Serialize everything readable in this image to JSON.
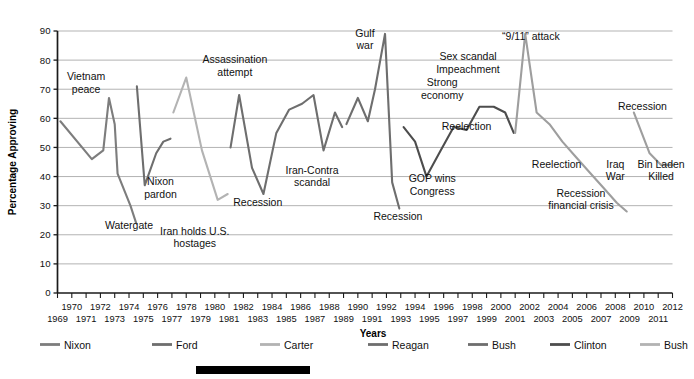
{
  "chart_data": {
    "type": "line",
    "title": "",
    "xlabel": "Years",
    "ylabel": "Percentage Approving",
    "ylim": [
      0,
      90
    ],
    "ytick_step": 10,
    "yticks": [
      "0",
      "10",
      "20",
      "30",
      "40",
      "50",
      "60",
      "70",
      "80",
      "90"
    ],
    "xlim": [
      1969,
      2012
    ],
    "grid": "horizontal",
    "legend_position": "bottom",
    "xticks_top_row": [
      "1970",
      "1972",
      "1974",
      "1976",
      "1978",
      "1980",
      "1982",
      "1984",
      "1986",
      "1988",
      "1990",
      "1992",
      "1994",
      "1996",
      "1998",
      "2000",
      "2002",
      "2004",
      "2006",
      "2008",
      "2010",
      "2012"
    ],
    "xticks_bottom_row": [
      "1969",
      "1971",
      "1973",
      "1975",
      "1977",
      "1979",
      "1981",
      "1983",
      "1985",
      "1987",
      "1989",
      "1991",
      "1993",
      "1995",
      "1997",
      "1999",
      "2001",
      "2003",
      "2005",
      "2007",
      "2009",
      "2011"
    ],
    "series": [
      {
        "name": "Nixon",
        "color": "#7d7d7d",
        "x": [
          1969.2,
          1971.4,
          1972.2,
          1972.6,
          1973.0,
          1973.2,
          1974.1,
          1974.5
        ],
        "values": [
          59,
          46,
          49,
          67,
          58,
          41,
          30,
          24
        ]
      },
      {
        "name": "Ford",
        "color": "#6e6e6e",
        "x": [
          1974.55,
          1975.1,
          1975.9,
          1976.4,
          1976.9
        ],
        "values": [
          71,
          37,
          48,
          52,
          53
        ]
      },
      {
        "name": "Carter",
        "color": "#b3b3b3",
        "x": [
          1977.1,
          1978.0,
          1979.1,
          1980.2,
          1980.9
        ],
        "values": [
          62,
          74,
          49,
          32,
          34
        ]
      },
      {
        "name": "Reagan",
        "color": "#6e6e6e",
        "x": [
          1981.1,
          1981.7,
          1982.6,
          1983.4,
          1984.3,
          1985.2,
          1986.1,
          1986.9,
          1987.6,
          1988.4,
          1988.9
        ],
        "values": [
          50,
          68,
          43,
          34,
          55,
          63,
          65,
          68,
          49,
          62,
          57
        ]
      },
      {
        "name": "Bush",
        "color": "#6e6e6e",
        "x": [
          1989.2,
          1990.0,
          1990.7,
          1991.2,
          1991.9,
          1992.4,
          1992.9
        ],
        "values": [
          58,
          67,
          59,
          70,
          89,
          38,
          29
        ]
      },
      {
        "name": "Clinton",
        "color": "#4d4d4d",
        "x": [
          1993.2,
          1994.0,
          1994.8,
          1995.8,
          1996.7,
          1997.6,
          1998.5,
          1999.5,
          2000.3,
          2000.9
        ],
        "values": [
          57,
          52,
          40,
          49,
          57,
          56,
          64,
          64,
          62,
          55
        ]
      },
      {
        "name": "Bush",
        "color": "#9e9e9e",
        "x": [
          2001.0,
          2001.7,
          2002.5,
          2003.4,
          2004.3,
          2005.2,
          2006.1,
          2007.2,
          2008.1,
          2008.8
        ],
        "values": [
          55,
          89,
          62,
          58,
          52,
          47,
          42,
          36,
          31,
          28
        ]
      },
      {
        "name": "Obama",
        "color": "#9e9e9e",
        "x": [
          2009.3,
          2010.4,
          2011.2,
          2012.0
        ],
        "values": [
          62,
          48,
          44,
          44
        ]
      }
    ],
    "annotations": [
      {
        "label": "Vietnam\npeace",
        "x": 1971.0,
        "y": 73
      },
      {
        "label": "Watergate",
        "x": 1974.0,
        "y": 22
      },
      {
        "label": "Nixon\npardon",
        "x": 1976.2,
        "y": 37
      },
      {
        "label": "Iran holds U.S.\nhostages",
        "x": 1978.6,
        "y": 20
      },
      {
        "label": "Assassination\nattempt",
        "x": 1981.4,
        "y": 79
      },
      {
        "label": "Recession",
        "x": 1983.0,
        "y": 30
      },
      {
        "label": "Iran-Contra\nscandal",
        "x": 1986.8,
        "y": 41
      },
      {
        "label": "Gulf\nwar",
        "x": 1990.5,
        "y": 88
      },
      {
        "label": "Recession",
        "x": 1992.8,
        "y": 25
      },
      {
        "label": "Strong\neconomy",
        "x": 1995.9,
        "y": 71
      },
      {
        "label": "GOP wins\nCongress",
        "x": 1995.2,
        "y": 38
      },
      {
        "label": "Sex scandal\nImpeachment",
        "x": 1997.7,
        "y": 80
      },
      {
        "label": "Reelection",
        "x": 1997.6,
        "y": 56
      },
      {
        "label": "“9/11” attack",
        "x": 2002.1,
        "y": 87
      },
      {
        "label": "Reelection",
        "x": 2003.9,
        "y": 43
      },
      {
        "label": "Recession\nfinancial crisis",
        "x": 2005.6,
        "y": 33
      },
      {
        "label": "Iraq\nWar",
        "x": 2008.0,
        "y": 43
      },
      {
        "label": "Recession",
        "x": 2009.9,
        "y": 63
      },
      {
        "label": "Bin Laden\nKilled",
        "x": 2011.2,
        "y": 43
      }
    ]
  },
  "legend": {
    "items": [
      {
        "label": "Nixon",
        "color": "#7d7d7d"
      },
      {
        "label": "Ford",
        "color": "#6e6e6e"
      },
      {
        "label": "Carter",
        "color": "#b3b3b3"
      },
      {
        "label": "Reagan",
        "color": "#6e6e6e"
      },
      {
        "label": "Bush",
        "color": "#6e6e6e"
      },
      {
        "label": "Clinton",
        "color": "#4d4d4d"
      },
      {
        "label": "Bush",
        "color": "#b3b3b3"
      }
    ]
  },
  "footer_bar": {
    "color": "#000000"
  }
}
